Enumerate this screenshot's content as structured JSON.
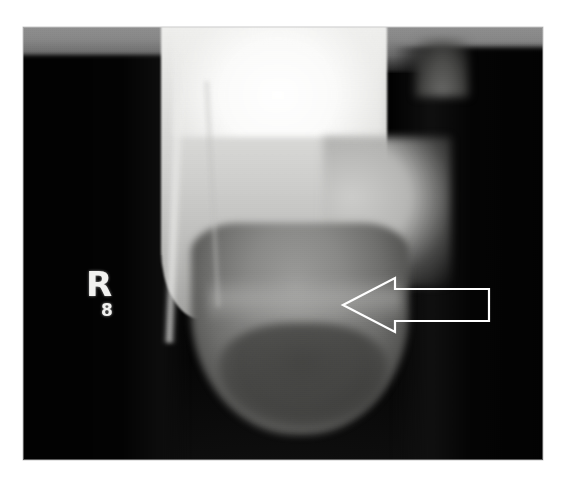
{
  "figure": {
    "type": "radiograph",
    "modality": "plain-film-xray",
    "caption": "",
    "background_color": "#ffffff",
    "plate": {
      "x": 23,
      "y": 27,
      "width": 520,
      "height": 433,
      "background_color": "#050505",
      "top_band_color": "#8f8f8f"
    }
  },
  "markers": {
    "laterality": {
      "label": "R",
      "name": "right-side-marker",
      "color": "#f2f2f0",
      "x": 63,
      "y": 240
    },
    "sub_marker": {
      "label": "8",
      "name": "marker-digit",
      "color": "#f2f2f0",
      "x": 78,
      "y": 275
    }
  },
  "annotations": {
    "arrow": {
      "name": "pointer-arrow",
      "direction": "left",
      "style": "outlined",
      "stroke_color": "#ffffff",
      "fill": "none",
      "stroke_width": 2,
      "tip_x": 320,
      "tip_y": 278,
      "tail_x": 462,
      "tail_y": 278,
      "points": "4,32 56,5 56,16 150,16 150,48 56,48 56,59"
    }
  },
  "anatomy": {
    "structures": [
      {
        "name": "bone-shaft",
        "label": "diaphysis / metaphysis",
        "tone": "radiopaque-bright"
      },
      {
        "name": "bone-head",
        "label": "distal epiphysis",
        "tone": "intermediate"
      },
      {
        "name": "soft-tissue-left",
        "label": "soft tissue shadow left",
        "tone": "radiolucent-dark"
      },
      {
        "name": "soft-tissue-right",
        "label": "soft tissue shadow right",
        "tone": "radiolucent-dark"
      }
    ]
  }
}
